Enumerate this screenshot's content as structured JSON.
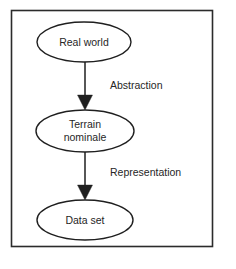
{
  "diagram": {
    "frame": {
      "name": "diagram-border"
    },
    "colors": {
      "background": "#ffffff",
      "stroke": "#1f1f1f",
      "frame_stroke": "#2b2b2b",
      "text": "#262626",
      "node_fill": "#ffffff"
    },
    "nodes": [
      {
        "id": "real-world",
        "shape": "ellipse",
        "label": "Real world",
        "lines": [
          "Real world"
        ],
        "cx": 84,
        "cy": 42,
        "rx": 47,
        "ry": 20
      },
      {
        "id": "terrain-nominale",
        "shape": "ellipse",
        "label": "Terrain nominale",
        "lines": [
          "Terrain",
          "nominale"
        ],
        "cx": 85,
        "cy": 131,
        "rx": 49,
        "ry": 21
      },
      {
        "id": "data-set",
        "shape": "ellipse",
        "label": "Data set",
        "lines": [
          "Data set"
        ],
        "cx": 85,
        "cy": 220,
        "rx": 48,
        "ry": 20
      }
    ],
    "edges": [
      {
        "id": "edge-abstraction",
        "from": "real-world",
        "to": "terrain-nominale",
        "label": "Abstraction",
        "label_x": 110,
        "label_y": 86
      },
      {
        "id": "edge-representation",
        "from": "terrain-nominale",
        "to": "data-set",
        "label": "Representation",
        "label_x": 110,
        "label_y": 173
      }
    ]
  }
}
